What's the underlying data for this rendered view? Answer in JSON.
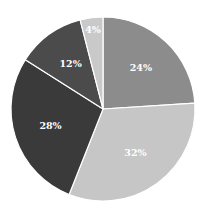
{
  "chart_data": {
    "type": "pie",
    "title": "",
    "start_angle": "12 o'clock",
    "direction": "clockwise",
    "legend": "none",
    "slices": [
      {
        "label": "24%",
        "value": 24,
        "color": "#8c8c8c"
      },
      {
        "label": "32%",
        "value": 32,
        "color": "#c6c6c6"
      },
      {
        "label": "28%",
        "value": 28,
        "color": "#3a3a3a"
      },
      {
        "label": "12%",
        "value": 12,
        "color": "#4b4b4b"
      },
      {
        "label": "4%",
        "value": 4,
        "color": "#c9c9c9"
      }
    ]
  }
}
